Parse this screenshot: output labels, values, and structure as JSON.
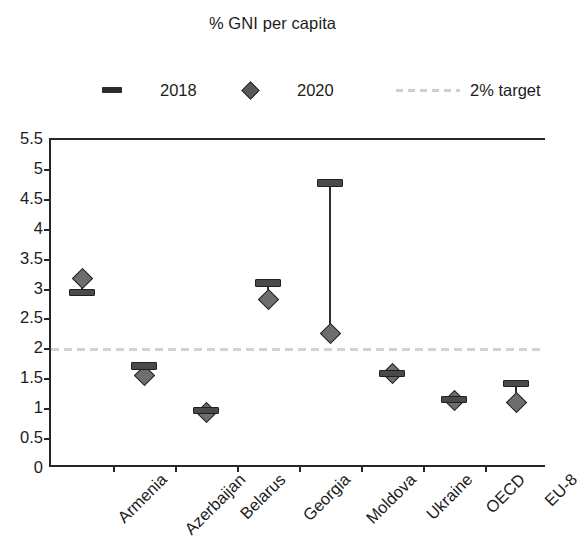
{
  "chart_data": {
    "type": "scatter",
    "title": "% GNI per capita",
    "xlabel": "",
    "ylabel": "",
    "ylim": [
      0,
      5.5
    ],
    "ytick_labels": [
      "5.5",
      "5",
      "4.5",
      "4",
      "3.5",
      "3",
      "2.5",
      "2",
      "1.5",
      "1",
      "0.5",
      "0"
    ],
    "ytick_values": [
      5.5,
      5,
      4.5,
      4,
      3.5,
      3,
      2.5,
      2,
      1.5,
      1,
      0.5,
      0
    ],
    "grid": false,
    "legend_position": "top",
    "categories": [
      "Armenia",
      "Azerbaijan",
      "Belarus",
      "Georgia",
      "Moldova",
      "Ukraine",
      "OECD",
      "EU-8"
    ],
    "series": [
      {
        "name": "2018",
        "marker": "dash",
        "color": "#4a4a4a",
        "values": [
          2.95,
          1.72,
          0.98,
          3.11,
          4.78,
          1.6,
          1.16,
          1.43
        ]
      },
      {
        "name": "2020",
        "marker": "diamond",
        "color": "#6e6e6e",
        "values": [
          3.19,
          1.56,
          0.95,
          2.84,
          2.27,
          1.6,
          1.15,
          1.12
        ]
      }
    ],
    "reference_lines": [
      {
        "name": "2% target",
        "value": 2.0,
        "style": "dashed",
        "color": "#d2d2d2"
      }
    ]
  },
  "legend": {
    "entries": [
      {
        "label": "2018",
        "marker": "dash-marker"
      },
      {
        "label": "2020",
        "marker": "diamond-marker"
      },
      {
        "label": "2% target",
        "marker": "dashed-line-marker"
      }
    ]
  },
  "colors": {
    "axis": "#262626",
    "series_2018": "#4a4a4a",
    "series_2020": "#6e6e6e",
    "target_line": "#d2d2d2",
    "background": "#ffffff",
    "text": "#1c1c1c"
  }
}
